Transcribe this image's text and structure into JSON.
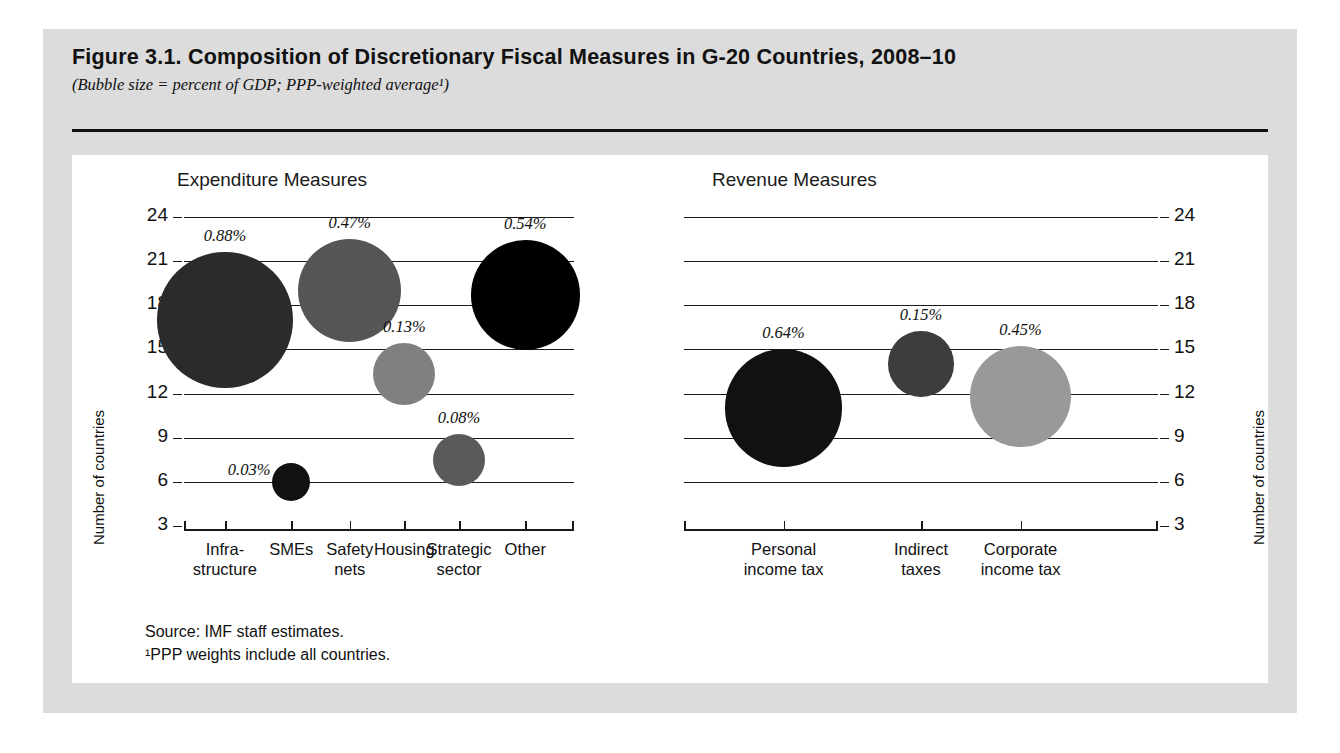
{
  "figure": {
    "title": "Figure 3.1.  Composition of Discretionary Fiscal Measures in G-20 Countries, 2008–10",
    "subtitle": "(Bubble size = percent of GDP; PPP-weighted average¹)",
    "source": "Source:  IMF staff estimates.",
    "footnote": "¹PPP weights include all countries."
  },
  "colors": {
    "page_background": "#ffffff",
    "frame_gray": "#dcdcdc",
    "panel_white": "#ffffff",
    "ink": "#111111",
    "gridline": "#1a1a1a"
  },
  "axis": {
    "y_label": "Number of countries",
    "y_ticks": [
      "24",
      "21",
      "18",
      "15",
      "12",
      "9",
      "6",
      "3"
    ],
    "y_min": 3,
    "y_max": 24
  },
  "chart_data": [
    {
      "type": "scatter",
      "title": "Expenditure Measures",
      "xlabel": "",
      "ylabel": "Number of countries",
      "ylim": [
        3,
        24
      ],
      "yticks": [
        24,
        21,
        18,
        15,
        12,
        9,
        6,
        3
      ],
      "grid": true,
      "legend": "none",
      "categories": [
        "Infra-\nstructure",
        "SMEs",
        "Safety\nnets",
        "Housing",
        "Strategic\nsector",
        "Other"
      ],
      "points": [
        {
          "category": "Infra-structure",
          "countries": 17.0,
          "size_pct": 0.88,
          "label": "0.88%",
          "color": "#2b2b2b"
        },
        {
          "category": "SMEs",
          "countries": 6.0,
          "size_pct": 0.03,
          "label": "0.03%",
          "color": "#111111"
        },
        {
          "category": "Safety nets",
          "countries": 19.0,
          "size_pct": 0.47,
          "label": "0.47%",
          "color": "#555555"
        },
        {
          "category": "Housing",
          "countries": 13.3,
          "size_pct": 0.13,
          "label": "0.13%",
          "color": "#808080"
        },
        {
          "category": "Strategic sector",
          "countries": 7.5,
          "size_pct": 0.08,
          "label": "0.08%",
          "color": "#5a5a5a"
        },
        {
          "category": "Other",
          "countries": 18.7,
          "size_pct": 0.54,
          "label": "0.54%",
          "color": "#000000"
        }
      ]
    },
    {
      "type": "scatter",
      "title": "Revenue Measures",
      "xlabel": "",
      "ylabel": "Number of countries",
      "ylim": [
        3,
        24
      ],
      "yticks": [
        24,
        21,
        18,
        15,
        12,
        9,
        6,
        3
      ],
      "grid": true,
      "legend": "none",
      "categories": [
        "Personal\nincome tax",
        "Indirect\ntaxes",
        "Corporate\nincome tax"
      ],
      "points": [
        {
          "category": "Personal income tax",
          "countries": 11.0,
          "size_pct": 0.64,
          "label": "0.64%",
          "color": "#111111"
        },
        {
          "category": "Indirect taxes",
          "countries": 14.0,
          "size_pct": 0.15,
          "label": "0.15%",
          "color": "#3d3d3d"
        },
        {
          "category": "Corporate income tax",
          "countries": 11.8,
          "size_pct": 0.45,
          "label": "0.45%",
          "color": "#999999"
        }
      ]
    }
  ]
}
